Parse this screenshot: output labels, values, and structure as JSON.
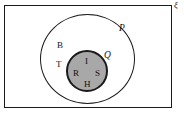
{
  "diagram": {
    "type": "venn-diagram",
    "universe": {
      "symbol": "ξ",
      "name": "universal-set"
    },
    "outer_circle": {
      "label": "P"
    },
    "inner_circle": {
      "label": "Q",
      "fill_color": "#a8a8a8"
    },
    "elements_in_p_only": [
      {
        "label": "B"
      },
      {
        "label": "T"
      }
    ],
    "elements_in_q": [
      {
        "label": "I"
      },
      {
        "label": "R"
      },
      {
        "label": "S"
      },
      {
        "label": "H"
      }
    ],
    "colors": {
      "stroke": "#1a1a1a",
      "background": "#ffffff",
      "shaded_region": "#a8a8a8"
    }
  }
}
